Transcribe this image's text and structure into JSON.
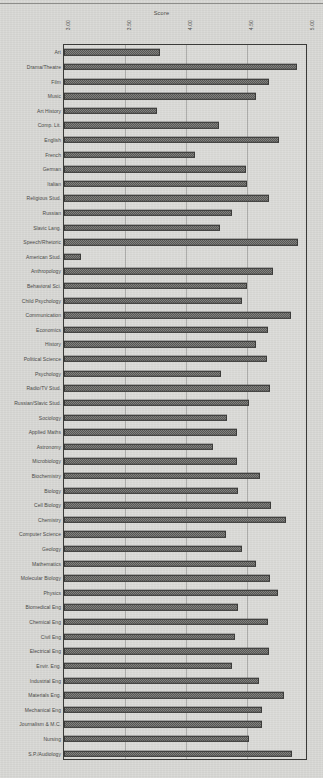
{
  "chart_data": {
    "type": "bar",
    "orientation": "horizontal",
    "title": "",
    "xlabel": "Score",
    "ylabel": "",
    "xlim": [
      3.0,
      5.0
    ],
    "xticks": [
      "3.00",
      "3.50",
      "4.00",
      "4.50",
      "5.00"
    ],
    "xtick_values": [
      3.0,
      3.5,
      4.0,
      4.5,
      5.0
    ],
    "grid": true,
    "legend": null,
    "bar_fill": "#5e5e5c",
    "frame_color": "#3a3a38",
    "background": "#d8d8d5",
    "categories": [
      "Art",
      "Drama/Theatre",
      "Film",
      "Music",
      "Art History",
      "Comp. Lit.",
      "English",
      "French",
      "German",
      "Italian",
      "Religious Stud.",
      "Russian",
      "Slavic Lang.",
      "Speech/Rhetoric",
      "American Stud.",
      "Anthropology",
      "Behavioral Sci.",
      "Child Psychology",
      "Communication",
      "Economics",
      "History",
      "Political Science",
      "Psychology",
      "Radio/TV Stud.",
      "Russian/Slavic Stud.",
      "Sociology",
      "Applied Maths",
      "Astronomy",
      "Microbiology",
      "Biochemistry",
      "Biology",
      "Cell Biology",
      "Chemistry",
      "Computer Science",
      "Geology",
      "Mathematics",
      "Molecular Biology",
      "Physics",
      "Biomedical Eng",
      "Chemical Eng",
      "Civil Eng",
      "Electrical Eng",
      "Envir. Eng.",
      "Industrial Eng",
      "Materials Eng.",
      "Mechanical Eng",
      "Journalism & M.C.",
      "Nursing",
      "S.P./Audiology"
    ],
    "values": [
      3.79,
      4.91,
      4.68,
      4.57,
      3.76,
      4.27,
      4.76,
      4.07,
      4.49,
      4.5,
      4.68,
      4.38,
      4.28,
      4.92,
      3.14,
      4.71,
      4.5,
      4.46,
      4.86,
      4.67,
      4.57,
      4.66,
      4.29,
      4.69,
      4.52,
      4.34,
      4.42,
      4.22,
      4.42,
      4.61,
      4.43,
      4.7,
      4.82,
      4.33,
      4.46,
      4.57,
      4.69,
      4.75,
      4.43,
      4.67,
      4.4,
      4.68,
      4.38,
      4.6,
      4.8,
      4.62,
      4.62,
      4.52,
      4.87
    ]
  }
}
